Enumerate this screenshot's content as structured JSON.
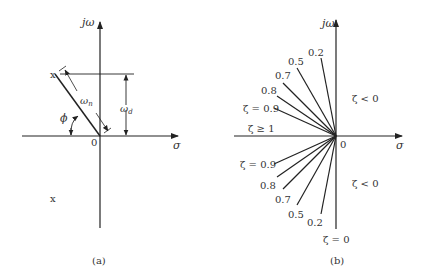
{
  "panel_a": {
    "y_axis_label": "jω",
    "x_axis_label": "σ",
    "origin_label": "0",
    "natural_freq_label": "ω",
    "natural_freq_sub": "n",
    "damped_freq_label": "ω",
    "damped_freq_sub": "d",
    "angle_label": "ϕ",
    "pole_upper": "x",
    "pole_lower": "x",
    "caption": "(a)"
  },
  "panel_b": {
    "y_axis_label": "jω",
    "x_axis_label": "σ",
    "origin_label": "0",
    "upper_labels": {
      "z02": "0.2",
      "z05": "0.5",
      "z07": "0.7",
      "z08": "0.8",
      "z09": "ζ = 0.9",
      "zge1": "ζ ≥ 1"
    },
    "lower_labels": {
      "z09": "ζ = 0.9",
      "z08": "0.8",
      "z07": "0.7",
      "z05": "0.5",
      "z02": "0.2",
      "z0": "ζ = 0"
    },
    "region_upper": "ζ < 0",
    "region_lower": "ζ < 0",
    "caption": "(b)"
  }
}
